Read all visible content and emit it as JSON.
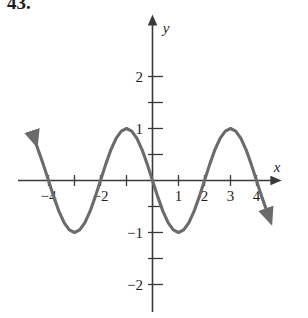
{
  "problem": {
    "number": "43."
  },
  "figure": {
    "name": "sinusoid-graph",
    "curve_color": "#6b6b6b",
    "axis_color": "#3a3a3a",
    "background": "#ffffff",
    "x_axis_label": "x",
    "y_axis_label": "y"
  },
  "chart_data": {
    "type": "line",
    "title": "",
    "subtitle": "",
    "xlabel": "x",
    "ylabel": "y",
    "xlim": [
      -5,
      4.6
    ],
    "ylim": [
      -2.6,
      2.5
    ],
    "grid": false,
    "legend": null,
    "x_ticks_labeled": [
      -4,
      -2,
      1,
      2,
      3,
      4
    ],
    "x_tick_labels": [
      "−4",
      "−2",
      "1",
      "2",
      "3",
      "4"
    ],
    "x_ticks_minor": [
      -5,
      -4,
      -3,
      -2,
      -1,
      1,
      2,
      3,
      4
    ],
    "y_ticks_labeled": [
      2,
      1,
      -1,
      -2
    ],
    "y_tick_labels": [
      "2",
      "1",
      "−1",
      "−2"
    ],
    "y_ticks_minor": [
      -2,
      -1.5,
      -1,
      -0.5,
      0.5,
      1,
      1.5,
      2
    ],
    "amplitude": 2,
    "period": 4,
    "equation": "y = -2 sin(pi x / 2)",
    "zeros": [
      -4,
      -2,
      0,
      2,
      4
    ],
    "maxima": [
      {
        "x": -1,
        "y": 2
      },
      {
        "x": 3,
        "y": 2
      }
    ],
    "minima": [
      {
        "x": -3,
        "y": -2
      },
      {
        "x": 1,
        "y": -2
      }
    ],
    "series": [
      {
        "name": "y = -2 sin(pi x / 2)",
        "color": "#6b6b6b",
        "arrow_start": true,
        "arrow_end": true,
        "x": [
          -4.6,
          -4.4,
          -4.2,
          -4.0,
          -3.8,
          -3.6,
          -3.4,
          -3.2,
          -3.0,
          -2.8,
          -2.6,
          -2.4,
          -2.2,
          -2.0,
          -1.8,
          -1.6,
          -1.4,
          -1.2,
          -1.0,
          -0.8,
          -0.6,
          -0.4,
          -0.2,
          0.0,
          0.2,
          0.4,
          0.6,
          0.8,
          1.0,
          1.2,
          1.4,
          1.6,
          1.8,
          2.0,
          2.2,
          2.4,
          2.6,
          2.8,
          3.0,
          3.2,
          3.4,
          3.6,
          3.8,
          4.0,
          4.2,
          4.4
        ],
        "y": [
          1.81,
          1.18,
          0.62,
          0.0,
          -0.62,
          -1.18,
          -1.62,
          -1.9,
          -2.0,
          -1.9,
          -1.62,
          -1.18,
          -0.62,
          0.0,
          0.62,
          1.18,
          1.62,
          1.9,
          2.0,
          1.9,
          1.62,
          1.18,
          0.62,
          0.0,
          -0.62,
          -1.18,
          -1.62,
          -1.9,
          -2.0,
          -1.9,
          -1.62,
          -1.18,
          -0.62,
          0.0,
          0.62,
          1.18,
          1.62,
          1.9,
          2.0,
          1.9,
          1.62,
          1.18,
          0.62,
          0.0,
          -0.62,
          -1.18
        ]
      }
    ]
  }
}
